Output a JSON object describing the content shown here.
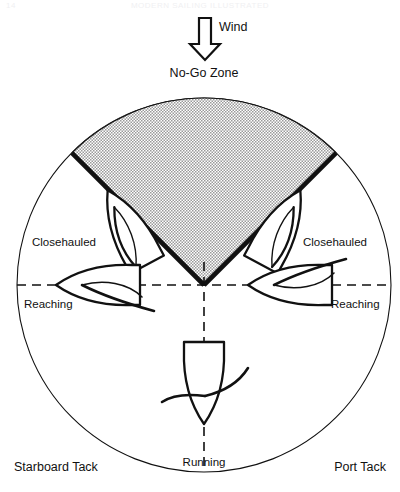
{
  "figure": {
    "title_ghost_center": "MODERN SAILING ILLUSTRATED",
    "title_ghost_left": "14",
    "wind_label": "Wind",
    "no_go_zone_label": "No-Go Zone",
    "labels": {
      "closehauled_left": "Closehauled",
      "closehauled_right": "Closehauled",
      "reaching_left": "Reaching",
      "reaching_right": "Reaching",
      "running": "Running",
      "starboard_tack": "Starboard Tack",
      "port_tack": "Port Tack"
    },
    "colors": {
      "ink": "#111111",
      "stipple": "#8d8d8d",
      "paper": "#ffffff"
    },
    "geometry": {
      "center_x": 204,
      "center_y": 285,
      "radius": 187,
      "no_go_half_angle_deg": 45
    }
  }
}
